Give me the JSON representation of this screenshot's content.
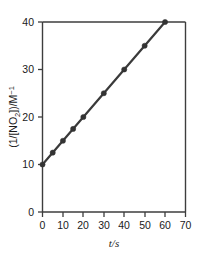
{
  "chart_data": {
    "type": "line",
    "title": "",
    "subtitle": "",
    "xlabel": "t/s",
    "ylabel": "(1/[NO2])/M^-1",
    "ylabel_parts": {
      "prefix": "(1/[NO",
      "subscript": "2",
      "middle": "])/M",
      "superscript": "−1"
    },
    "xlim": [
      0,
      70
    ],
    "ylim": [
      0,
      40
    ],
    "xticks": [
      0,
      10,
      20,
      30,
      40,
      50,
      60,
      70
    ],
    "yticks": [
      0,
      10,
      20,
      30,
      40
    ],
    "xtick_labels": [
      "0",
      "10",
      "20",
      "30",
      "40",
      "50",
      "60",
      "70"
    ],
    "ytick_labels": [
      "0",
      "10",
      "20",
      "30",
      "40"
    ],
    "grid": false,
    "legend": "none",
    "series": [
      {
        "name": "1/[NO2] vs t",
        "marker": "circle",
        "color": "#333333",
        "line_color": "#3a3a3a",
        "x": [
          0,
          5,
          10,
          15,
          20,
          30,
          40,
          50,
          60
        ],
        "y": [
          10.0,
          12.5,
          15.0,
          17.5,
          20.0,
          25.0,
          30.0,
          35.0,
          40.0
        ]
      }
    ],
    "fit": {
      "slope": 0.5,
      "intercept": 10.0,
      "x_start": 0,
      "x_end": 60
    }
  },
  "colors": {
    "axis": "#3d3d3d",
    "data": "#333333",
    "background": "#ffffff"
  },
  "caption": {
    "ghost_text": ""
  }
}
